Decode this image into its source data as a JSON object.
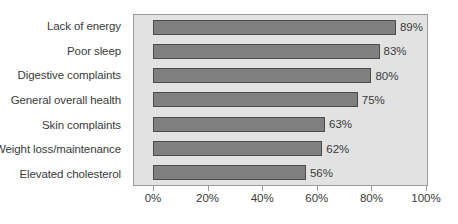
{
  "chart_data": {
    "type": "bar",
    "orientation": "horizontal",
    "title": "",
    "subtitle": "",
    "xlabel": "",
    "ylabel": "",
    "categories": [
      "Lack of energy",
      "Poor sleep",
      "Digestive complaints",
      "General overall health",
      "Skin complaints",
      "Weight loss/maintenance",
      "Elevated cholesterol"
    ],
    "values": [
      89,
      83,
      80,
      75,
      63,
      62,
      56
    ],
    "value_labels": [
      "89%",
      "83%",
      "80%",
      "75%",
      "63%",
      "62%",
      "56%"
    ],
    "xlim": [
      0,
      100
    ],
    "xticks": [
      0,
      20,
      40,
      60,
      80,
      100
    ],
    "xtick_labels": [
      "0%",
      "20%",
      "40%",
      "60%",
      "80%",
      "100%"
    ],
    "grid": false,
    "legend": false,
    "colors": {
      "bar_fill": "#808080",
      "bar_border": "#4a4a4a",
      "plot_background": "#e2e2e2",
      "plot_border": "#9a9a9a",
      "text": "#3a3a3a",
      "page_background": "#ffffff"
    }
  }
}
